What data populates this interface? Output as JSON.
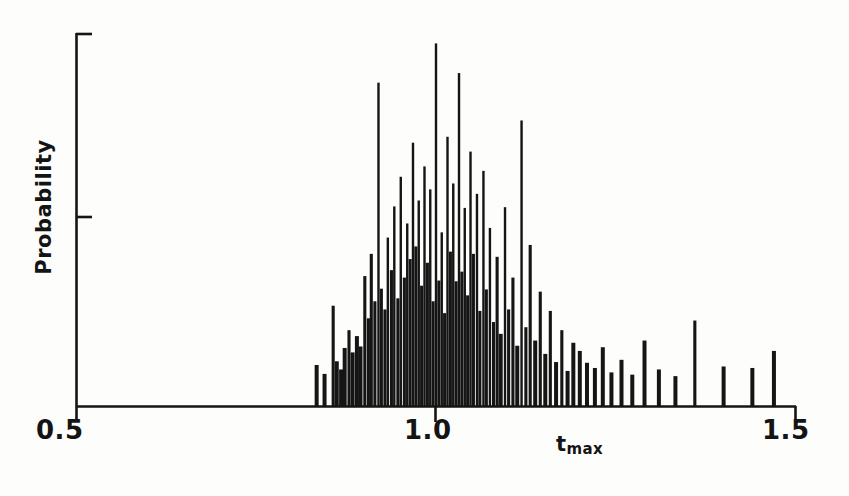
{
  "chart_data": {
    "type": "bar",
    "title": "",
    "subtitle": "",
    "xlabel": "t_max",
    "xlabel_base": "t",
    "xlabel_sub": "max",
    "ylabel": "Probability",
    "xlim": [
      0.5,
      1.5
    ],
    "ylim": [
      0.0,
      1.0
    ],
    "xticks": [
      0.5,
      1.0,
      1.5
    ],
    "xtick_labels": [
      "0.5",
      "1.0",
      "1.5"
    ],
    "yticks": [
      0.0,
      0.5,
      1.0
    ],
    "ytick_labels": [
      "",
      "",
      ""
    ],
    "grid": false,
    "legend": null,
    "annotations": [],
    "bar_width": 0.0035,
    "x": [
      0.834,
      0.845,
      0.857,
      0.862,
      0.868,
      0.873,
      0.879,
      0.884,
      0.89,
      0.895,
      0.901,
      0.906,
      0.91,
      0.915,
      0.92,
      0.924,
      0.929,
      0.933,
      0.938,
      0.942,
      0.947,
      0.951,
      0.956,
      0.96,
      0.964,
      0.968,
      0.972,
      0.976,
      0.98,
      0.984,
      0.988,
      0.992,
      0.996,
      1.0,
      1.004,
      1.008,
      1.012,
      1.016,
      1.02,
      1.024,
      1.028,
      1.032,
      1.036,
      1.04,
      1.044,
      1.048,
      1.052,
      1.057,
      1.061,
      1.066,
      1.07,
      1.075,
      1.08,
      1.085,
      1.09,
      1.096,
      1.101,
      1.107,
      1.113,
      1.119,
      1.125,
      1.131,
      1.138,
      1.145,
      1.152,
      1.159,
      1.167,
      1.175,
      1.183,
      1.191,
      1.2,
      1.21,
      1.221,
      1.232,
      1.244,
      1.258,
      1.273,
      1.29,
      1.31,
      1.333,
      1.36,
      1.4,
      1.44,
      1.47
    ],
    "values": [
      0.112,
      0.088,
      0.272,
      0.122,
      0.1,
      0.158,
      0.206,
      0.146,
      0.19,
      0.162,
      0.352,
      0.238,
      0.412,
      0.284,
      0.874,
      0.318,
      0.262,
      0.456,
      0.368,
      0.54,
      0.292,
      0.62,
      0.348,
      0.494,
      0.398,
      0.712,
      0.432,
      0.556,
      0.326,
      0.648,
      0.388,
      0.586,
      0.284,
      0.98,
      0.34,
      0.47,
      0.252,
      0.728,
      0.418,
      0.602,
      0.338,
      0.9,
      0.364,
      0.536,
      0.3,
      0.688,
      0.412,
      0.574,
      0.258,
      0.636,
      0.316,
      0.482,
      0.228,
      0.404,
      0.196,
      0.538,
      0.262,
      0.348,
      0.164,
      0.772,
      0.214,
      0.436,
      0.178,
      0.31,
      0.142,
      0.258,
      0.12,
      0.206,
      0.096,
      0.172,
      0.15,
      0.118,
      0.104,
      0.16,
      0.092,
      0.126,
      0.086,
      0.178,
      0.1,
      0.082,
      0.232,
      0.108,
      0.104,
      0.15
    ]
  },
  "axes": {
    "x_tick_left": "0.5",
    "x_tick_mid": "1.0",
    "x_tick_right": "1.5",
    "y_axis_title": "Probability",
    "x_axis_title_base": "t",
    "x_axis_title_sub": "max"
  },
  "style": {
    "ink_color": "#151515",
    "background": "#fdfdfc"
  }
}
